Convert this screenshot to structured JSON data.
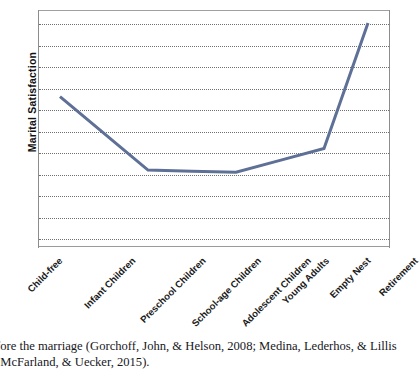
{
  "figure": {
    "ylabel": "Marital Satisfaction",
    "caption_line_1": "fore the marriage (Gorchoff, John, & Helson, 2008; Medina, Lederhos, & Lillis",
    "caption_line_2": ", McFarland, & Uecker, 2015)."
  },
  "chart_data": {
    "type": "line",
    "title": "",
    "xlabel": "",
    "ylabel": "Marital Satisfaction",
    "categories": [
      "Child-free",
      "Infant Children",
      "Preschool Children",
      "School-age Children",
      "Adolescent Children",
      "Young Adults",
      "Empty Nest",
      "Retirement"
    ],
    "values": [
      7.0,
      5.3,
      3.6,
      3.55,
      3.5,
      4.05,
      4.6,
      10.4
    ],
    "ylim": [
      0,
      11
    ],
    "yticks": [
      1,
      2,
      3,
      4,
      5,
      6,
      7,
      8,
      9,
      10,
      11
    ],
    "ytick_labels": [],
    "grid": "horizontal-dotted",
    "legend": "none",
    "series": [
      {
        "name": "Marital Satisfaction",
        "color": "#5e7096",
        "values": [
          7.0,
          5.3,
          3.6,
          3.55,
          3.5,
          4.05,
          4.6,
          10.4
        ]
      }
    ],
    "annotation": "U-shaped curve: satisfaction declines from child-free through adolescent children, then rises sharply after empty nest into retirement."
  },
  "colors": {
    "line": "#5e7096",
    "grid": "#6f6f6f",
    "axis": "#8c8c8c",
    "text": "#1a1a1a",
    "background": "#ffffff"
  }
}
